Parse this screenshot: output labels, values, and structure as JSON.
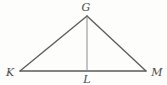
{
  "figure": {
    "kind": "geometry-diagram",
    "width": 167,
    "height": 84,
    "background_color": "#fdfdfc",
    "stroke_color": "#5a5a5a",
    "altitude_stroke_color": "#8c8c8c",
    "label_color": "#4a4a4a"
  },
  "points": {
    "G": {
      "label": "G",
      "x": 87,
      "y": 16,
      "label_x": 86,
      "label_y": 7
    },
    "K": {
      "label": "K",
      "x": 20,
      "y": 71,
      "label_x": 10,
      "label_y": 72
    },
    "L": {
      "label": "L",
      "x": 87,
      "y": 71,
      "label_x": 87,
      "label_y": 79
    },
    "M": {
      "label": "M",
      "x": 146,
      "y": 71,
      "label_x": 157,
      "label_y": 72
    }
  },
  "segments": [
    {
      "name": "side-KG",
      "from": "K",
      "to": "G",
      "x1": 20,
      "y1": 71,
      "x2": 87,
      "y2": 16,
      "color": "#5a5a5a",
      "width": 1.3
    },
    {
      "name": "side-GM",
      "from": "G",
      "to": "M",
      "x1": 87,
      "y1": 16,
      "x2": 146,
      "y2": 71,
      "color": "#5a5a5a",
      "width": 1.3
    },
    {
      "name": "base-KM",
      "from": "K",
      "to": "M",
      "x1": 20,
      "y1": 71,
      "x2": 146,
      "y2": 71,
      "color": "#5a5a5a",
      "width": 1.3
    },
    {
      "name": "altitude-GL",
      "from": "G",
      "to": "L",
      "x1": 87,
      "y1": 16,
      "x2": 87,
      "y2": 71,
      "color": "#8c8c8c",
      "width": 1.0
    }
  ]
}
